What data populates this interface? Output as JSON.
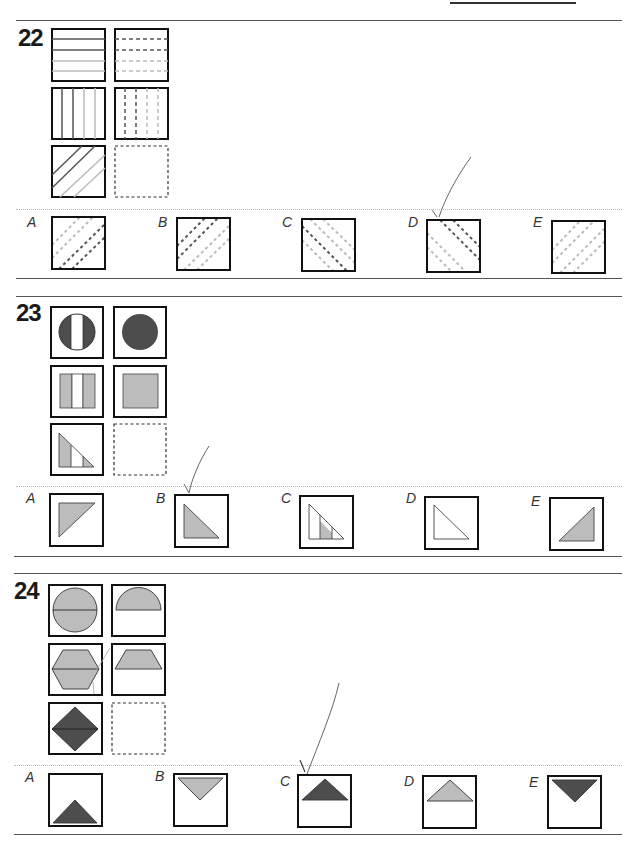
{
  "page": {
    "type": "non-verbal reasoning worksheet",
    "questions": [
      {
        "number": "22",
        "grid_description": "3x2 matrix of hatched squares; bottom-right missing",
        "grid": [
          [
            "horizontal lines: 2 dark, 2 light",
            "horizontal dashed lines: 2 dark, 2 light"
          ],
          [
            "vertical lines: 2 dark, 2 light",
            "vertical dashed lines: 2 dark, 2 light"
          ],
          [
            "diagonal lines (/): 2 dark, 2 light",
            "missing"
          ]
        ],
        "options": [
          {
            "label": "A",
            "description": "diagonal dashed /, light then dark"
          },
          {
            "label": "B",
            "description": "diagonal dashed /, dark then light"
          },
          {
            "label": "C",
            "description": "diagonal dashed \\, mixed"
          },
          {
            "label": "D",
            "description": "diagonal dashed \\, dark and light",
            "marked": true
          },
          {
            "label": "E",
            "description": "diagonal dashed /, all light"
          }
        ]
      },
      {
        "number": "23",
        "grid_description": "3x2 matrix of shapes; stripes removed to solid",
        "grid": [
          [
            "circle with white middle stripe (dark)",
            "solid dark circle"
          ],
          [
            "grey square with white middle stripe",
            "solid grey square"
          ],
          [
            "right triangle with white middle stripe (grey)",
            "missing"
          ]
        ],
        "options": [
          {
            "label": "A",
            "description": "grey triangle pointing down-left"
          },
          {
            "label": "B",
            "description": "grey right triangle",
            "marked": true
          },
          {
            "label": "C",
            "description": "striped right triangle"
          },
          {
            "label": "D",
            "description": "white right triangle"
          },
          {
            "label": "E",
            "description": "grey triangle, right-angle at bottom right"
          }
        ]
      },
      {
        "number": "24",
        "grid_description": "3x2 matrix; shape halved, top half kept",
        "grid": [
          [
            "grey circle with horizontal midline",
            "grey top semicircle"
          ],
          [
            "grey hexagon with horizontal midline",
            "grey top trapezoid"
          ],
          [
            "dark diamond with horizontal midline",
            "missing"
          ]
        ],
        "options": [
          {
            "label": "A",
            "description": "dark triangle at bottom"
          },
          {
            "label": "B",
            "description": "grey inverted triangle at top"
          },
          {
            "label": "C",
            "description": "dark triangle at top",
            "marked": true
          },
          {
            "label": "D",
            "description": "grey triangle at top"
          },
          {
            "label": "E",
            "description": "dark inverted triangle at top"
          }
        ]
      }
    ]
  },
  "colors": {
    "dark": "#555555",
    "darkfill": "#4d4d4d",
    "light": "#bdbdbd",
    "grey": "#bcbcbc",
    "border": "#111111",
    "pencil": "#666666"
  }
}
